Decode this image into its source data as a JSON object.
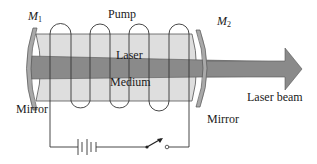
{
  "diagram": {
    "labels": {
      "pump": "Pump",
      "laser": "Laser",
      "medium": "Medium",
      "mirror_left_symbol": "M",
      "mirror_left_sub": "1",
      "mirror_right_symbol": "M",
      "mirror_right_sub": "2",
      "mirror_left": "Mirror",
      "mirror_right": "Mirror",
      "laser_beam": "Laser beam"
    },
    "components": [
      {
        "name": "mirror-m1",
        "type": "curved mirror"
      },
      {
        "name": "gain-medium-tube",
        "type": "cylinder"
      },
      {
        "name": "pump-coil",
        "type": "helical coil",
        "turns": 4
      },
      {
        "name": "mirror-m2",
        "type": "partially transmitting curved mirror"
      },
      {
        "name": "battery",
        "type": "dc source"
      },
      {
        "name": "switch",
        "type": "open switch"
      },
      {
        "name": "laser-beam",
        "type": "arrow"
      }
    ],
    "colors": {
      "tube_fill": "#dedede",
      "beam_fill": "#8a8a8a",
      "mirror_fill": "#a9a9a9",
      "line": "#333333",
      "background": "#ffffff"
    }
  }
}
